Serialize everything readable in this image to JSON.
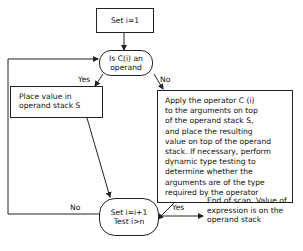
{
  "diagram": {
    "type": "flowchart",
    "nodes": {
      "start": {
        "id": "start",
        "shape": "rectangle",
        "lines": [
          "Set i=1"
        ]
      },
      "decision_operand": {
        "id": "decision_operand",
        "shape": "rounded",
        "lines": [
          "Is C(i) an",
          "operand"
        ]
      },
      "place_value": {
        "id": "place_value",
        "shape": "rectangle",
        "lines": [
          "Place value in",
          "operand stack S"
        ]
      },
      "apply_operator": {
        "id": "apply_operator",
        "shape": "rectangle",
        "lines": [
          "Apply the operator C (i)",
          "to the arguments on top",
          "of the operand stack S,",
          "and place the resulting",
          "value on top of the operand",
          "stack. If necessary, perform",
          "dynamic type testing to",
          "determine whether the",
          "arguments are of the type",
          "required by the operator"
        ]
      },
      "increment_test": {
        "id": "increment_test",
        "shape": "rounded",
        "lines": [
          "Set i=i+1",
          "Test i>n"
        ]
      },
      "end": {
        "id": "end",
        "shape": "text",
        "lines": [
          "End of scan. Value of",
          "expression is on the",
          "operand stack"
        ]
      }
    },
    "edges": [
      {
        "from": "start",
        "to": "decision_operand",
        "label": ""
      },
      {
        "from": "decision_operand",
        "to": "place_value",
        "label": "Yes"
      },
      {
        "from": "decision_operand",
        "to": "apply_operator",
        "label": "No"
      },
      {
        "from": "place_value",
        "to": "increment_test",
        "label": ""
      },
      {
        "from": "apply_operator",
        "to": "increment_test",
        "label": ""
      },
      {
        "from": "increment_test",
        "to": "decision_operand",
        "label": "No"
      },
      {
        "from": "increment_test",
        "to": "end",
        "label": "Yes"
      }
    ],
    "edge_labels": {
      "yes_top": "Yes",
      "no_top": "No",
      "no_bottom": "No",
      "yes_bottom": "Yes"
    },
    "line_color": "#222222",
    "background": "#ffffff"
  }
}
